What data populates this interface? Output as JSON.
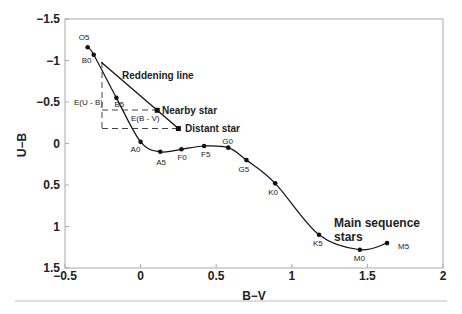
{
  "chart_data": {
    "type": "line",
    "title": "",
    "xlabel": "B−V",
    "ylabel": "U−B",
    "xlim": [
      -0.5,
      2
    ],
    "ylim": [
      -1.5,
      1.5
    ],
    "y_inverted": true,
    "grid": false,
    "legend": null,
    "x_ticks": [
      "−0.5",
      "0",
      "0.5",
      "1",
      "1.5",
      "2"
    ],
    "y_ticks": [
      "−1.5",
      "−1",
      "−0.5",
      "0",
      "0.5",
      "1",
      "1.5"
    ],
    "series": [
      {
        "name": "Main sequence stars",
        "points": [
          {
            "label": "O5",
            "x": -0.35,
            "y": -1.16
          },
          {
            "label": "B0",
            "x": -0.31,
            "y": -1.07
          },
          {
            "label": "B5",
            "x": -0.16,
            "y": -0.55
          },
          {
            "label": "A0",
            "x": 0.0,
            "y": -0.02
          },
          {
            "label": "A5",
            "x": 0.13,
            "y": 0.1
          },
          {
            "label": "F0",
            "x": 0.27,
            "y": 0.07
          },
          {
            "label": "F5",
            "x": 0.42,
            "y": 0.03
          },
          {
            "label": "G0",
            "x": 0.58,
            "y": 0.05
          },
          {
            "label": "G5",
            "x": 0.7,
            "y": 0.2
          },
          {
            "label": "K0",
            "x": 0.89,
            "y": 0.48
          },
          {
            "label": "K5",
            "x": 1.18,
            "y": 1.1
          },
          {
            "label": "M0",
            "x": 1.45,
            "y": 1.28
          },
          {
            "label": "M5",
            "x": 1.63,
            "y": 1.2
          }
        ]
      },
      {
        "name": "Reddening line",
        "points": [
          {
            "label": "",
            "x": -0.26,
            "y": -0.98
          },
          {
            "label": "Nearby star",
            "x": 0.11,
            "y": -0.4
          },
          {
            "label": "Distant star",
            "x": 0.25,
            "y": -0.18
          }
        ]
      }
    ],
    "annotations": [
      {
        "text": "Reddening line",
        "x": -0.05,
        "y": -0.78
      },
      {
        "text": "Nearby star",
        "x": 0.14,
        "y": -0.4
      },
      {
        "text": "Distant star",
        "x": 0.28,
        "y": -0.18
      },
      {
        "text": "E(U - B)",
        "x": -0.42,
        "y": -0.52
      },
      {
        "text": "E(B - V)",
        "x": -0.12,
        "y": -0.3
      },
      {
        "text": "Main sequence stars",
        "x": 1.28,
        "y": 0.8
      }
    ]
  },
  "labels": {
    "x_axis_title": "B−V",
    "y_axis_title": "U−B",
    "reddening_line": "Reddening line",
    "nearby_star": "Nearby  star",
    "distant_star": "Distant star",
    "e_ub": "E(U - B)",
    "e_bv": "E(B - V)",
    "main_seq_line1": "Main sequence",
    "main_seq_line2": "stars"
  },
  "colors": {
    "curve": "#111111",
    "frame": "#aaaaaa",
    "dash": "#444444",
    "separator": "#dddddd"
  }
}
